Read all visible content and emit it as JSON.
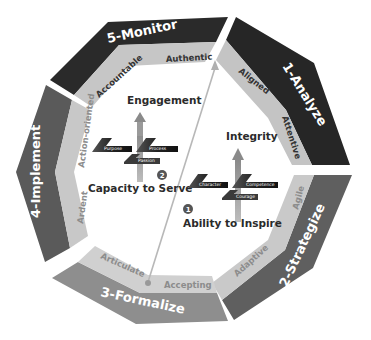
{
  "diagram": {
    "segments": [
      {
        "id": "analyze",
        "label": "1-Analyze",
        "color": "#262626",
        "inner_color": "#c4c4c4",
        "inner_words": [
          "Aligned",
          "Attentive"
        ]
      },
      {
        "id": "strategize",
        "label": "2-Strategize",
        "color": "#5f5f5f",
        "inner_color": "#c9c9c9",
        "inner_words": [
          "Agile",
          "Adaptive"
        ]
      },
      {
        "id": "formalize",
        "label": "3-Formalize",
        "color": "#8e8e8e",
        "inner_color": "#d0d0d0",
        "inner_words": [
          "Accepting",
          "Articulate"
        ]
      },
      {
        "id": "implement",
        "label": "4-Implement",
        "color": "#5a5a5a",
        "inner_color": "#c8c8c8",
        "inner_words": [
          "Ardent",
          "Action-oriented"
        ]
      },
      {
        "id": "monitor",
        "label": "5-Monitor",
        "color": "#2a2a2a",
        "inner_color": "#c6c6c6",
        "inner_words": [
          "Accountable",
          "Authentic"
        ]
      }
    ],
    "center": {
      "group1": {
        "number": "1",
        "title": "Ability to Inspire",
        "goal": "Integrity",
        "links": [
          "Character",
          "Competence",
          "Courage"
        ]
      },
      "group2": {
        "number": "2",
        "title": "Capacity to Serve",
        "goal": "Engagement",
        "links": [
          "Purpose",
          "Process",
          "Passion"
        ]
      }
    }
  }
}
